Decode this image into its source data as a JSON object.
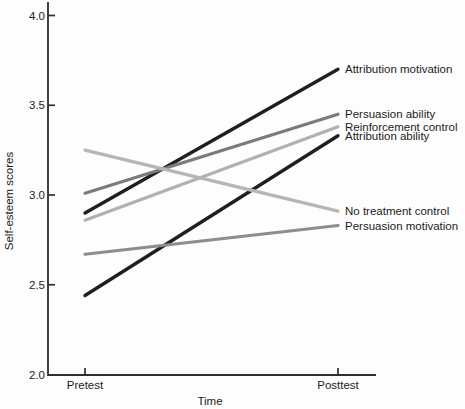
{
  "chart_data": {
    "type": "line",
    "title": "",
    "xlabel": "Time",
    "ylabel": "Self-esteem scores",
    "x_categories": [
      "Pretest",
      "Posttest"
    ],
    "ylim": [
      2.0,
      4.0
    ],
    "y_ticks": [
      4.0,
      3.5,
      3.0,
      2.5,
      2.0
    ],
    "y_tick_labels": [
      "4.0",
      "3.5",
      "3.0",
      "2.5",
      "2.0"
    ],
    "grid": false,
    "legend_position": "labels-at-line-ends-right",
    "axis_color": "#2e2e2e",
    "series": [
      {
        "name": "Attribution motivation",
        "values": [
          2.9,
          3.7
        ],
        "color": "#1f1f1f"
      },
      {
        "name": "Persuasion ability",
        "values": [
          3.01,
          3.45
        ],
        "color": "#7b7b7b"
      },
      {
        "name": "Reinforcement control",
        "values": [
          2.86,
          3.38
        ],
        "color": "#b1b1b1"
      },
      {
        "name": "Attribution ability",
        "values": [
          2.44,
          3.33
        ],
        "color": "#1f1f1f"
      },
      {
        "name": "No treatment control",
        "values": [
          3.25,
          2.91
        ],
        "color": "#b6b6b6"
      },
      {
        "name": "Persuasion motivation",
        "values": [
          2.67,
          2.83
        ],
        "color": "#8d8d8d"
      }
    ]
  }
}
